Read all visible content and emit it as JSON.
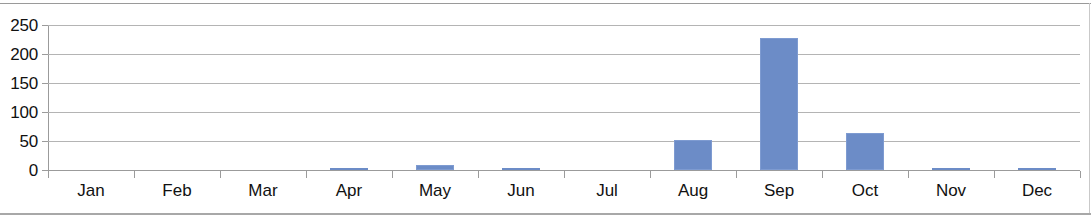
{
  "chart_data": {
    "type": "bar",
    "title": "",
    "subtitle": "",
    "xlabel": "",
    "ylabel": "",
    "categories": [
      "Jan",
      "Feb",
      "Mar",
      "Apr",
      "May",
      "Jun",
      "Jul",
      "Aug",
      "Sep",
      "Oct",
      "Nov",
      "Dec"
    ],
    "values": [
      0,
      0,
      0,
      1,
      8,
      4,
      0,
      51,
      227,
      63,
      1,
      1
    ],
    "series": [
      {
        "name": "",
        "values": [
          0,
          0,
          0,
          1,
          8,
          4,
          0,
          51,
          227,
          63,
          1,
          1
        ]
      }
    ],
    "ylim": [
      0,
      250
    ],
    "ytick_values": [
      0,
      50,
      100,
      150,
      200,
      250
    ],
    "ytick_labels": [
      "0",
      "50",
      "100",
      "150",
      "200",
      "250"
    ],
    "xtick_labels": [
      "Jan",
      "Feb",
      "Mar",
      "Apr",
      "May",
      "Jun",
      "Jul",
      "Aug",
      "Sep",
      "Oct",
      "Nov",
      "Dec"
    ],
    "grid": true,
    "grid_axis": "y",
    "legend": false,
    "legend_position": "none",
    "annotations": [],
    "colors": {
      "bar": "#6c8cc7",
      "bar_border": "#7e9bd1",
      "gridline": "#b4b4b4",
      "axis": "#9b9b9b",
      "frame": "#9a9a9a",
      "text": "#111111",
      "background": "#ffffff"
    }
  }
}
